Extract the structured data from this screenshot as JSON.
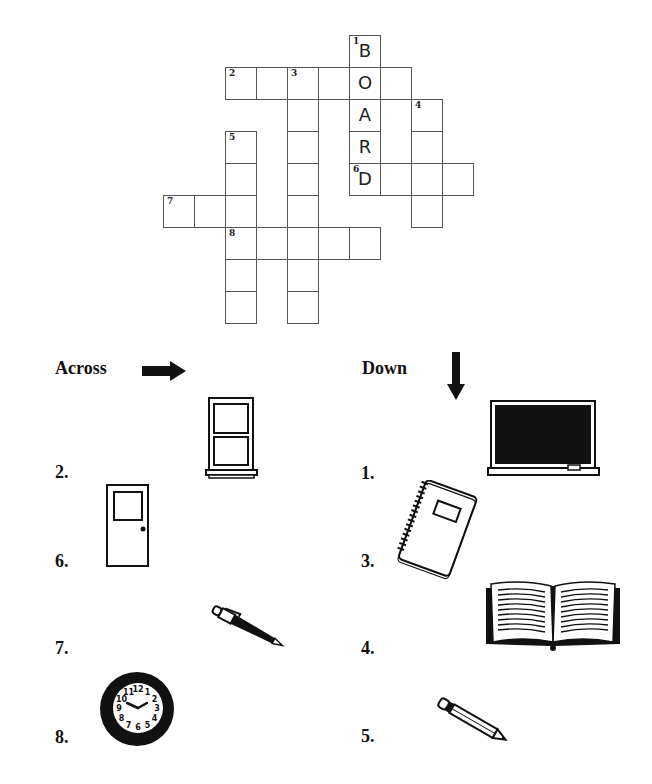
{
  "puzzle": {
    "cell_width": 31,
    "cell_height": 32,
    "origin_x": 163,
    "origin_y": 35,
    "cells": [
      {
        "r": 0,
        "c": 6,
        "num": "1",
        "letter": "B"
      },
      {
        "r": 1,
        "c": 2,
        "num": "2",
        "letter": ""
      },
      {
        "r": 1,
        "c": 3,
        "num": "",
        "letter": ""
      },
      {
        "r": 1,
        "c": 4,
        "num": "3",
        "letter": ""
      },
      {
        "r": 1,
        "c": 5,
        "num": "",
        "letter": ""
      },
      {
        "r": 1,
        "c": 6,
        "num": "",
        "letter": "O"
      },
      {
        "r": 1,
        "c": 7,
        "num": "",
        "letter": ""
      },
      {
        "r": 2,
        "c": 4,
        "num": "",
        "letter": ""
      },
      {
        "r": 2,
        "c": 6,
        "num": "",
        "letter": "A"
      },
      {
        "r": 2,
        "c": 8,
        "num": "4",
        "letter": ""
      },
      {
        "r": 3,
        "c": 2,
        "num": "5",
        "letter": ""
      },
      {
        "r": 3,
        "c": 4,
        "num": "",
        "letter": ""
      },
      {
        "r": 3,
        "c": 6,
        "num": "",
        "letter": "R"
      },
      {
        "r": 3,
        "c": 8,
        "num": "",
        "letter": ""
      },
      {
        "r": 4,
        "c": 2,
        "num": "",
        "letter": ""
      },
      {
        "r": 4,
        "c": 4,
        "num": "",
        "letter": ""
      },
      {
        "r": 4,
        "c": 6,
        "num": "6",
        "letter": "D"
      },
      {
        "r": 4,
        "c": 7,
        "num": "",
        "letter": ""
      },
      {
        "r": 4,
        "c": 8,
        "num": "",
        "letter": ""
      },
      {
        "r": 4,
        "c": 9,
        "num": "",
        "letter": ""
      },
      {
        "r": 5,
        "c": 0,
        "num": "7",
        "letter": ""
      },
      {
        "r": 5,
        "c": 1,
        "num": "",
        "letter": ""
      },
      {
        "r": 5,
        "c": 2,
        "num": "",
        "letter": ""
      },
      {
        "r": 5,
        "c": 4,
        "num": "",
        "letter": ""
      },
      {
        "r": 5,
        "c": 8,
        "num": "",
        "letter": ""
      },
      {
        "r": 6,
        "c": 2,
        "num": "8",
        "letter": ""
      },
      {
        "r": 6,
        "c": 3,
        "num": "",
        "letter": ""
      },
      {
        "r": 6,
        "c": 4,
        "num": "",
        "letter": ""
      },
      {
        "r": 6,
        "c": 5,
        "num": "",
        "letter": ""
      },
      {
        "r": 6,
        "c": 6,
        "num": "",
        "letter": ""
      },
      {
        "r": 7,
        "c": 2,
        "num": "",
        "letter": ""
      },
      {
        "r": 7,
        "c": 4,
        "num": "",
        "letter": ""
      },
      {
        "r": 8,
        "c": 2,
        "num": "",
        "letter": ""
      },
      {
        "r": 8,
        "c": 4,
        "num": "",
        "letter": ""
      }
    ]
  },
  "across": {
    "heading": "Across",
    "arrow_icon": "arrow-right-icon",
    "clues": [
      {
        "label": "2.",
        "picture": "window-icon"
      },
      {
        "label": "6.",
        "picture": "door-icon"
      },
      {
        "label": "7.",
        "picture": "pen-icon"
      },
      {
        "label": "8.",
        "picture": "clock-icon"
      }
    ]
  },
  "down": {
    "heading": "Down",
    "arrow_icon": "arrow-down-icon",
    "clues": [
      {
        "label": "1.",
        "picture": "chalkboard-icon"
      },
      {
        "label": "3.",
        "picture": "notebook-icon"
      },
      {
        "label": "4.",
        "picture": "book-icon"
      },
      {
        "label": "5.",
        "picture": "pencil-icon"
      }
    ]
  },
  "clock_face": {
    "numbers": [
      "12",
      "1",
      "2",
      "3",
      "4",
      "5",
      "6",
      "7",
      "8",
      "9",
      "10",
      "11"
    ]
  },
  "colors": {
    "ink": "#111111",
    "grid_line": "#555555",
    "background": "#ffffff"
  }
}
